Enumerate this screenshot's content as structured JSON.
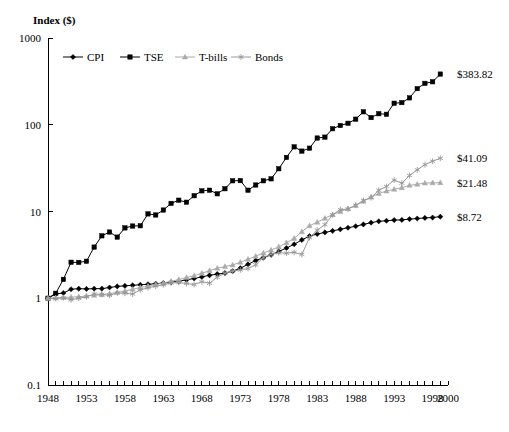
{
  "chart_data": {
    "type": "line",
    "title": "",
    "ylabel": "Index ($)",
    "xlabel": "",
    "yscale": "log",
    "ylim": [
      0.1,
      1000
    ],
    "ytick_labels": [
      "1000",
      "100",
      "10",
      "1",
      "0.1"
    ],
    "ytick_values": [
      1000,
      100,
      10,
      1,
      0.1
    ],
    "xlim": [
      1948,
      2000
    ],
    "xtick_labels": [
      "1948",
      "1953",
      "1958",
      "1963",
      "1968",
      "1973",
      "1978",
      "1983",
      "1988",
      "1993",
      "1998",
      "2000"
    ],
    "xtick_values": [
      1948,
      1953,
      1958,
      1963,
      1968,
      1973,
      1978,
      1983,
      1988,
      1993,
      1998,
      2000
    ],
    "minor_xticks_every": 1,
    "grid": false,
    "legend_position": "top-left-inside",
    "x": [
      1948,
      1949,
      1950,
      1951,
      1952,
      1953,
      1954,
      1955,
      1956,
      1957,
      1958,
      1959,
      1960,
      1961,
      1962,
      1963,
      1964,
      1965,
      1966,
      1967,
      1968,
      1969,
      1970,
      1971,
      1972,
      1973,
      1974,
      1975,
      1976,
      1977,
      1978,
      1979,
      1980,
      1981,
      1982,
      1983,
      1984,
      1985,
      1986,
      1987,
      1988,
      1989,
      1990,
      1991,
      1992,
      1993,
      1994,
      1995,
      1996,
      1997,
      1998,
      1999
    ],
    "series": [
      {
        "name": "CPI",
        "marker": "diamond",
        "color": "#000000",
        "end_label": "$8.72",
        "end_value": 8.72,
        "values": [
          1.0,
          1.12,
          1.15,
          1.27,
          1.29,
          1.28,
          1.29,
          1.29,
          1.33,
          1.37,
          1.39,
          1.41,
          1.43,
          1.45,
          1.47,
          1.5,
          1.53,
          1.57,
          1.63,
          1.69,
          1.76,
          1.84,
          1.9,
          1.95,
          2.05,
          2.22,
          2.46,
          2.72,
          2.93,
          3.17,
          3.46,
          3.79,
          4.19,
          4.7,
          5.21,
          5.5,
          5.74,
          5.98,
          6.23,
          6.5,
          6.76,
          7.1,
          7.44,
          7.71,
          7.82,
          7.96,
          8.0,
          8.17,
          8.3,
          8.43,
          8.52,
          8.72
        ]
      },
      {
        "name": "TSE",
        "marker": "square",
        "color": "#000000",
        "end_label": "$383.82",
        "end_value": 383.82,
        "values": [
          1.0,
          1.14,
          1.65,
          2.6,
          2.59,
          2.67,
          3.89,
          5.24,
          5.8,
          5.07,
          6.47,
          6.8,
          6.85,
          9.38,
          9.12,
          10.4,
          12.4,
          13.5,
          12.8,
          15.2,
          17.3,
          17.6,
          16.0,
          18.3,
          22.6,
          22.7,
          17.6,
          20.2,
          22.6,
          23.8,
          31.1,
          42.0,
          55.6,
          49.7,
          53.7,
          70.3,
          72.0,
          90.0,
          98.0,
          104.0,
          116.0,
          141.0,
          121.0,
          134.0,
          132.0,
          177.0,
          180.0,
          204.0,
          261.0,
          300.0,
          313.0,
          383.82
        ]
      },
      {
        "name": "T-bills",
        "marker": "triangle",
        "color": "#aaaaaa",
        "end_label": "$21.48",
        "end_value": 21.48,
        "values": [
          1.0,
          1.01,
          1.02,
          1.03,
          1.04,
          1.06,
          1.08,
          1.1,
          1.13,
          1.17,
          1.21,
          1.27,
          1.33,
          1.38,
          1.44,
          1.5,
          1.57,
          1.64,
          1.73,
          1.82,
          1.94,
          2.08,
          2.22,
          2.32,
          2.42,
          2.6,
          2.82,
          3.05,
          3.33,
          3.6,
          3.91,
          4.36,
          4.9,
          5.85,
          6.86,
          7.52,
          8.37,
          9.2,
          9.99,
          10.78,
          11.73,
          13.13,
          14.72,
          16.13,
          17.21,
          18.02,
          18.83,
          20.02,
          20.58,
          21.28,
          21.4,
          21.48
        ]
      },
      {
        "name": "Bonds",
        "marker": "asterisk",
        "color": "#999999",
        "end_label": "$41.09",
        "end_value": 41.09,
        "values": [
          1.0,
          0.99,
          1.01,
          0.96,
          1.0,
          1.04,
          1.12,
          1.11,
          1.08,
          1.15,
          1.14,
          1.12,
          1.25,
          1.32,
          1.38,
          1.43,
          1.5,
          1.52,
          1.48,
          1.44,
          1.55,
          1.49,
          1.75,
          1.94,
          2.06,
          2.12,
          2.2,
          2.43,
          2.95,
          3.21,
          3.34,
          3.31,
          3.38,
          3.2,
          5.0,
          6.1,
          7.05,
          9.15,
          10.5,
          10.7,
          11.8,
          13.4,
          14.4,
          17.6,
          19.4,
          23.0,
          21.2,
          26.0,
          30.2,
          34.7,
          38.0,
          41.09
        ]
      }
    ]
  },
  "legend": {
    "items": [
      {
        "label": "CPI"
      },
      {
        "label": "TSE"
      },
      {
        "label": "T-bills"
      },
      {
        "label": "Bonds"
      }
    ]
  }
}
